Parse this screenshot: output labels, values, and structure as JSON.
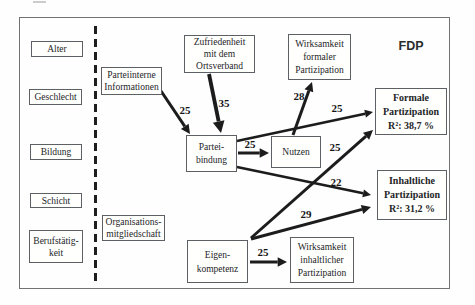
{
  "diagram": {
    "corner_label": "FDP",
    "boxes": {
      "alter": {
        "lines": [
          "Alter"
        ]
      },
      "geschlecht": {
        "lines": [
          "Geschlecht"
        ]
      },
      "bildung": {
        "lines": [
          "Bildung"
        ]
      },
      "schicht": {
        "lines": [
          "Schicht"
        ]
      },
      "berufstaetigkeit": {
        "lines": [
          "Berufstätig-",
          "keit"
        ]
      },
      "parteiinterne_informationen": {
        "lines": [
          "Parteiinterne",
          "Informationen"
        ]
      },
      "zufriedenheit_ortsverband": {
        "lines": [
          "Zufriedenheit",
          "mit dem",
          "Ortsverband"
        ]
      },
      "organisationsmitgliedschaft": {
        "lines": [
          "Organisations-",
          "mitgliedschaft"
        ]
      },
      "parteibindung": {
        "lines": [
          "Partei-",
          "bindung"
        ]
      },
      "nutzen": {
        "lines": [
          "Nutzen"
        ]
      },
      "eigenkompetenz": {
        "lines": [
          "Eigen-",
          "kompetenz"
        ]
      },
      "wirksamkeit_formaler": {
        "lines": [
          "Wirksamkeit",
          "formaler",
          "Partizipation"
        ]
      },
      "wirksamkeit_inhaltlicher": {
        "lines": [
          "Wirksamkeit",
          "inhaltlicher",
          "Partizipation"
        ]
      },
      "formale_partizipation": {
        "lines": [
          "Formale",
          "Partizipation",
          "R²: 38,7 %"
        ]
      },
      "inhaltliche_partizipation": {
        "lines": [
          "Inhaltliche",
          "Partizipation",
          "R²: 31,2 %"
        ]
      }
    },
    "arrows": [
      {
        "from": "parteiinterne-informationen",
        "to": "parteibindung",
        "label": "25",
        "x1": 161,
        "y1": 91,
        "x2": 190,
        "y2": 134,
        "lx": 185,
        "ly": 114,
        "w": 3
      },
      {
        "from": "zufriedenheit-ortsverband",
        "to": "parteibindung",
        "label": "35",
        "x1": 209,
        "y1": 74,
        "x2": 221,
        "y2": 133,
        "lx": 224,
        "ly": 107,
        "w": 3.8
      },
      {
        "from": "parteibindung",
        "to": "nutzen",
        "label": "25",
        "x1": 238,
        "y1": 153,
        "x2": 269,
        "y2": 153,
        "lx": 250,
        "ly": 148,
        "w": 3
      },
      {
        "from": "nutzen",
        "to": "wirksamkeit-formaler-partizipation",
        "label": "28",
        "x1": 293,
        "y1": 135,
        "x2": 312,
        "y2": 82,
        "lx": 299,
        "ly": 100,
        "w": 3
      },
      {
        "from": "parteibindung",
        "to": "formale-partizipation",
        "label": "25",
        "x1": 237,
        "y1": 141,
        "x2": 373,
        "y2": 112,
        "lx": 337,
        "ly": 112,
        "w": 2.6
      },
      {
        "from": "eigenkompetenz",
        "to": "formale-partizipation",
        "label": "25",
        "x1": 251,
        "y1": 238,
        "x2": 373,
        "y2": 130,
        "lx": 335,
        "ly": 151,
        "w": 3
      },
      {
        "from": "parteibindung",
        "to": "inhaltliche-partizipation",
        "label": "22",
        "x1": 237,
        "y1": 167,
        "x2": 371,
        "y2": 195,
        "lx": 336,
        "ly": 186,
        "w": 2.6
      },
      {
        "from": "eigenkompetenz",
        "to": "inhaltliche-partizipation",
        "label": "29",
        "x1": 251,
        "y1": 239,
        "x2": 371,
        "y2": 207,
        "lx": 306,
        "ly": 218,
        "w": 3
      },
      {
        "from": "eigenkompetenz",
        "to": "wirksamkeit-inhaltlicher-partizipation",
        "label": "25",
        "x1": 250,
        "y1": 262,
        "x2": 287,
        "y2": 262,
        "lx": 263,
        "ly": 256,
        "w": 3
      }
    ],
    "colors": {
      "ink": "#1c1c1c",
      "box_border": "#5c5f63",
      "frame_border": "#707274"
    }
  }
}
